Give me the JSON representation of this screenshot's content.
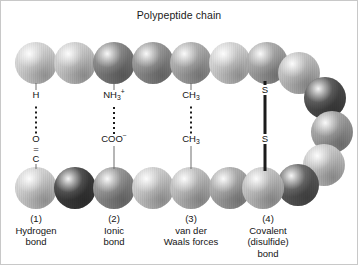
{
  "figure": {
    "title": "Polypeptide chain",
    "width": 358,
    "height": 265,
    "background": "#ffffff",
    "border_color": "#c8c8c8"
  },
  "palette": {
    "very_light": "#d6d6d6",
    "light": "#c4c4c4",
    "medium_light": "#b0b0b0",
    "medium": "#9a9a9a",
    "medium_dark": "#848484",
    "dark": "#6a6a6a",
    "very_dark": "#4a4a4a",
    "darkest": "#3a3a3a",
    "line_color": "#1c1c1c",
    "stem_color": "#6e6e6e",
    "text_color": "#141414"
  },
  "chain": {
    "description": "Polypeptide chain folded into a hairpin; residues drawn as shaded spheres",
    "top_strand": [
      {
        "cx": 35,
        "cy": 62,
        "r": 21,
        "shade": "#d2d2d2"
      },
      {
        "cx": 74,
        "cy": 62,
        "r": 21,
        "shade": "#c9c9c9"
      },
      {
        "cx": 113,
        "cy": 62,
        "r": 21,
        "shade": "#7e7e7e"
      },
      {
        "cx": 152,
        "cy": 62,
        "r": 21,
        "shade": "#8f8f8f"
      },
      {
        "cx": 190,
        "cy": 62,
        "r": 21,
        "shade": "#a8a8a8"
      },
      {
        "cx": 229,
        "cy": 62,
        "r": 21,
        "shade": "#cfcfcf"
      },
      {
        "cx": 266,
        "cy": 62,
        "r": 21,
        "shade": "#a3a3a3"
      }
    ],
    "right_turn": [
      {
        "cx": 298,
        "cy": 72,
        "r": 21,
        "shade": "#bdbdbd"
      },
      {
        "cx": 324,
        "cy": 97,
        "r": 21,
        "shade": "#4c4c4c"
      },
      {
        "cx": 331,
        "cy": 131,
        "r": 21,
        "shade": "#9d9d9d"
      },
      {
        "cx": 323,
        "cy": 164,
        "r": 21,
        "shade": "#c6c6c6"
      },
      {
        "cx": 297,
        "cy": 184,
        "r": 21,
        "shade": "#5a5a5a"
      }
    ],
    "bottom_strand": [
      {
        "cx": 35,
        "cy": 187,
        "r": 21,
        "shade": "#cfcfcf"
      },
      {
        "cx": 74,
        "cy": 187,
        "r": 21,
        "shade": "#3e3e3e"
      },
      {
        "cx": 113,
        "cy": 187,
        "r": 21,
        "shade": "#8d8d8d"
      },
      {
        "cx": 152,
        "cy": 187,
        "r": 21,
        "shade": "#c9c9c9"
      },
      {
        "cx": 190,
        "cy": 187,
        "r": 21,
        "shade": "#bcbcbc"
      },
      {
        "cx": 229,
        "cy": 187,
        "r": 21,
        "shade": "#a6a6a6"
      },
      {
        "cx": 262,
        "cy": 187,
        "r": 21,
        "shade": "#bfbfbf"
      }
    ]
  },
  "bonds": [
    {
      "id": "hydrogen",
      "number": "(1)",
      "name_line1": "Hydrogen",
      "name_line2": "bond",
      "x": 35,
      "style": "dotted",
      "upper_group": "H",
      "lower_group_atom1": "O",
      "lower_group_connector": "=",
      "lower_group_atom2": "C"
    },
    {
      "id": "ionic",
      "number": "(2)",
      "name_line1": "Ionic",
      "name_line2": "bond",
      "x": 113,
      "style": "dotted",
      "upper_group_base": "NH",
      "upper_group_sub": "3",
      "upper_group_sup": "+",
      "lower_group_base": "COO",
      "lower_group_sup": "−"
    },
    {
      "id": "van-der-waals",
      "number": "(3)",
      "name_line1": "van der",
      "name_line2": "Waals forces",
      "x": 190,
      "style": "dotted",
      "upper_group_base": "CH",
      "upper_group_sub": "3",
      "lower_group_base": "CH",
      "lower_group_sub": "3"
    },
    {
      "id": "covalent-disulfide",
      "number": "(4)",
      "name_line1": "Covalent",
      "name_line2": "(disulfide)",
      "name_line3": "bond",
      "x": 264,
      "style": "solid",
      "upper_group": "S",
      "lower_group": "S"
    }
  ]
}
